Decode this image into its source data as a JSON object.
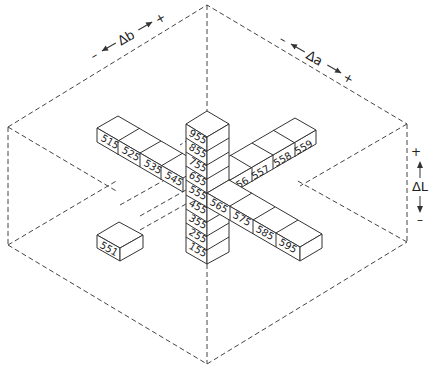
{
  "diagram": {
    "axes": {
      "b": {
        "label": "Δb",
        "minus": "–",
        "plus": "+"
      },
      "a": {
        "label": "Δa",
        "minus": "–",
        "plus": "+"
      },
      "L": {
        "label": "ΔL",
        "minus": "–",
        "plus": "+"
      }
    },
    "vertical_column": [
      "955",
      "855",
      "755",
      "655",
      "555",
      "455",
      "355",
      "255",
      "155"
    ],
    "b_arm": [
      "515",
      "525",
      "535",
      "545"
    ],
    "a_arm": [
      "556",
      "557",
      "558",
      "559"
    ],
    "a_arm_front": [
      "565",
      "575",
      "585",
      "595"
    ],
    "isolated_block": "551",
    "colors": {
      "line": "#333333",
      "background": "#ffffff"
    }
  }
}
